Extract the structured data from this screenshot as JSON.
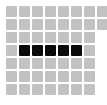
{
  "widget": {
    "name": "pixel-grid-selector",
    "background_color": "#ffffff",
    "canvas_width": 107,
    "canvas_height": 105
  },
  "grid": {
    "rows": 7,
    "columns": 8,
    "full_columns_visible": 7,
    "clipped_last_column": true,
    "cell_size": 11,
    "cell_pitch_x": 13,
    "cell_pitch_y": 13,
    "origin_x": 6,
    "origin_y": 6,
    "cell_radius": 1,
    "colors": {
      "unselected": "#c2c2c2",
      "selected": "#0a0a0a"
    },
    "legend": {
      "unselected_label": "empty",
      "selected_label": "filled"
    },
    "cells": [
      [
        {
          "row": 1,
          "col": 1,
          "state": "empty",
          "clipped": false
        },
        {
          "row": 1,
          "col": 2,
          "state": "empty",
          "clipped": false
        },
        {
          "row": 1,
          "col": 3,
          "state": "empty",
          "clipped": false
        },
        {
          "row": 1,
          "col": 4,
          "state": "empty",
          "clipped": false
        },
        {
          "row": 1,
          "col": 5,
          "state": "empty",
          "clipped": false
        },
        {
          "row": 1,
          "col": 6,
          "state": "empty",
          "clipped": false
        },
        {
          "row": 1,
          "col": 7,
          "state": "empty",
          "clipped": false
        },
        {
          "row": 1,
          "col": 8,
          "state": "empty",
          "clipped": true
        }
      ],
      [
        {
          "row": 2,
          "col": 1,
          "state": "empty",
          "clipped": false
        },
        {
          "row": 2,
          "col": 2,
          "state": "empty",
          "clipped": false
        },
        {
          "row": 2,
          "col": 3,
          "state": "empty",
          "clipped": false
        },
        {
          "row": 2,
          "col": 4,
          "state": "empty",
          "clipped": false
        },
        {
          "row": 2,
          "col": 5,
          "state": "empty",
          "clipped": false
        },
        {
          "row": 2,
          "col": 6,
          "state": "empty",
          "clipped": false
        },
        {
          "row": 2,
          "col": 7,
          "state": "empty",
          "clipped": false
        },
        {
          "row": 2,
          "col": 8,
          "state": "empty",
          "clipped": true
        }
      ],
      [
        {
          "row": 3,
          "col": 1,
          "state": "empty",
          "clipped": false
        },
        {
          "row": 3,
          "col": 2,
          "state": "empty",
          "clipped": false
        },
        {
          "row": 3,
          "col": 3,
          "state": "empty",
          "clipped": false
        },
        {
          "row": 3,
          "col": 4,
          "state": "empty",
          "clipped": false
        },
        {
          "row": 3,
          "col": 5,
          "state": "empty",
          "clipped": false
        },
        {
          "row": 3,
          "col": 6,
          "state": "empty",
          "clipped": false
        },
        {
          "row": 3,
          "col": 7,
          "state": "empty",
          "clipped": false
        }
      ],
      [
        {
          "row": 4,
          "col": 1,
          "state": "empty",
          "clipped": false
        },
        {
          "row": 4,
          "col": 2,
          "state": "filled",
          "clipped": false
        },
        {
          "row": 4,
          "col": 3,
          "state": "filled",
          "clipped": false
        },
        {
          "row": 4,
          "col": 4,
          "state": "filled",
          "clipped": false
        },
        {
          "row": 4,
          "col": 5,
          "state": "filled",
          "clipped": false
        },
        {
          "row": 4,
          "col": 6,
          "state": "filled",
          "clipped": false
        },
        {
          "row": 4,
          "col": 7,
          "state": "empty",
          "clipped": false
        }
      ],
      [
        {
          "row": 5,
          "col": 1,
          "state": "empty",
          "clipped": false
        },
        {
          "row": 5,
          "col": 2,
          "state": "empty",
          "clipped": false
        },
        {
          "row": 5,
          "col": 3,
          "state": "empty",
          "clipped": false
        },
        {
          "row": 5,
          "col": 4,
          "state": "empty",
          "clipped": false
        },
        {
          "row": 5,
          "col": 5,
          "state": "empty",
          "clipped": false
        },
        {
          "row": 5,
          "col": 6,
          "state": "empty",
          "clipped": false
        },
        {
          "row": 5,
          "col": 7,
          "state": "empty",
          "clipped": false
        }
      ],
      [
        {
          "row": 6,
          "col": 1,
          "state": "empty",
          "clipped": false
        },
        {
          "row": 6,
          "col": 2,
          "state": "empty",
          "clipped": false
        },
        {
          "row": 6,
          "col": 3,
          "state": "empty",
          "clipped": false
        },
        {
          "row": 6,
          "col": 4,
          "state": "empty",
          "clipped": false
        },
        {
          "row": 6,
          "col": 5,
          "state": "empty",
          "clipped": false
        },
        {
          "row": 6,
          "col": 6,
          "state": "empty",
          "clipped": false
        },
        {
          "row": 6,
          "col": 7,
          "state": "empty",
          "clipped": false
        }
      ],
      [
        {
          "row": 7,
          "col": 1,
          "state": "empty",
          "clipped": false
        },
        {
          "row": 7,
          "col": 2,
          "state": "empty",
          "clipped": false
        },
        {
          "row": 7,
          "col": 3,
          "state": "empty",
          "clipped": false
        },
        {
          "row": 7,
          "col": 4,
          "state": "empty",
          "clipped": false
        },
        {
          "row": 7,
          "col": 5,
          "state": "empty",
          "clipped": false
        },
        {
          "row": 7,
          "col": 6,
          "state": "empty",
          "clipped": false
        },
        {
          "row": 7,
          "col": 7,
          "state": "empty",
          "clipped": false
        }
      ]
    ],
    "selected_count": 5,
    "selected_row": 4,
    "selected_columns": [
      2,
      3,
      4,
      5,
      6
    ]
  }
}
